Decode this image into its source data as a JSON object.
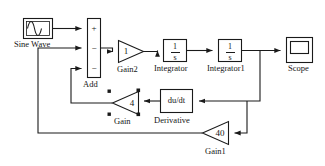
{
  "diagram": {
    "line_color": "#1a1a1a",
    "text_color": "#151515",
    "background": "#ffffff"
  },
  "blocks": {
    "sine_wave": {
      "label": "Sine Wave",
      "icon": "sine-wave-icon",
      "type": "source"
    },
    "add": {
      "label": "Add",
      "type": "sum",
      "signs": [
        "+",
        "−",
        "−"
      ]
    },
    "gain2": {
      "label": "Gain2",
      "value": "1",
      "type": "gain",
      "direction": "right"
    },
    "integrator": {
      "label": "Integrator",
      "numerator": "1",
      "denominator": "s",
      "type": "integrator"
    },
    "integrator1": {
      "label": "Integrator1",
      "numerator": "1",
      "denominator": "s",
      "type": "integrator"
    },
    "scope": {
      "label": "Scope",
      "icon": "scope-icon",
      "type": "sink"
    },
    "gain": {
      "label": "Gain",
      "value": "4",
      "type": "gain",
      "direction": "left"
    },
    "derivative": {
      "label": "Derivative",
      "value": "du/dt",
      "type": "derivative"
    },
    "gain1": {
      "label": "Gain1",
      "value": "40",
      "type": "gain",
      "direction": "left"
    }
  }
}
